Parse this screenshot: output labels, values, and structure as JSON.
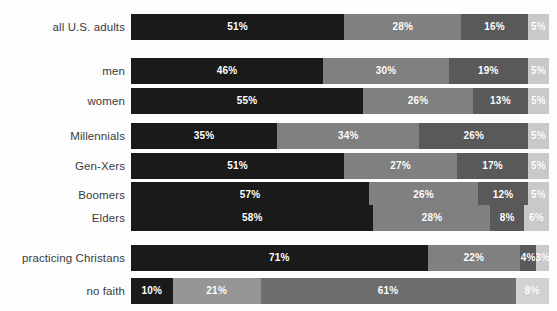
{
  "chart_data": {
    "type": "bar",
    "subtype": "horizontal-stacked-100",
    "title": "",
    "subtitle": "",
    "xlabel": "",
    "ylabel": "",
    "xlim": [
      0,
      100
    ],
    "grid": false,
    "legend": "none",
    "stacked": true,
    "unit": "%",
    "categories": [
      "all U.S. adults",
      "men",
      "women",
      "Millennials",
      "Gen-Xers",
      "Boomers",
      "Elders",
      "practicing Christans",
      "no faith"
    ],
    "series": [
      {
        "name": "segment-1",
        "values": [
          51,
          46,
          55,
          35,
          51,
          57,
          58,
          71,
          10
        ]
      },
      {
        "name": "segment-2",
        "values": [
          28,
          30,
          26,
          34,
          27,
          26,
          28,
          22,
          21
        ]
      },
      {
        "name": "segment-3",
        "values": [
          16,
          19,
          13,
          26,
          17,
          12,
          8,
          4,
          61
        ]
      },
      {
        "name": "segment-4",
        "values": [
          5,
          5,
          5,
          5,
          5,
          5,
          6,
          3,
          8
        ]
      }
    ],
    "rows": [
      {
        "label": "all U.S. adults",
        "group": 0,
        "segments": [
          {
            "value": 51,
            "label": "51%",
            "color": "#1a1a1a"
          },
          {
            "value": 28,
            "label": "28%",
            "color": "#808080"
          },
          {
            "value": 16,
            "label": "16%",
            "color": "#595959"
          },
          {
            "value": 5,
            "label": "5%",
            "color": "#c9c9c9"
          }
        ]
      },
      {
        "label": "men",
        "group": 1,
        "segments": [
          {
            "value": 46,
            "label": "46%",
            "color": "#1a1a1a"
          },
          {
            "value": 30,
            "label": "30%",
            "color": "#808080"
          },
          {
            "value": 19,
            "label": "19%",
            "color": "#595959"
          },
          {
            "value": 5,
            "label": "5%",
            "color": "#c9c9c9"
          }
        ]
      },
      {
        "label": "women",
        "group": 1,
        "segments": [
          {
            "value": 55,
            "label": "55%",
            "color": "#1a1a1a"
          },
          {
            "value": 26,
            "label": "26%",
            "color": "#808080"
          },
          {
            "value": 13,
            "label": "13%",
            "color": "#595959"
          },
          {
            "value": 5,
            "label": "5%",
            "color": "#c9c9c9"
          }
        ]
      },
      {
        "label": "Millennials",
        "group": 2,
        "segments": [
          {
            "value": 35,
            "label": "35%",
            "color": "#1a1a1a"
          },
          {
            "value": 34,
            "label": "34%",
            "color": "#808080"
          },
          {
            "value": 26,
            "label": "26%",
            "color": "#595959"
          },
          {
            "value": 5,
            "label": "5%",
            "color": "#c9c9c9"
          }
        ]
      },
      {
        "label": "Gen-Xers",
        "group": 2,
        "segments": [
          {
            "value": 51,
            "label": "51%",
            "color": "#1a1a1a"
          },
          {
            "value": 27,
            "label": "27%",
            "color": "#808080"
          },
          {
            "value": 17,
            "label": "17%",
            "color": "#595959"
          },
          {
            "value": 5,
            "label": "5%",
            "color": "#c9c9c9"
          }
        ]
      },
      {
        "label": "Boomers",
        "group": 2,
        "segments": [
          {
            "value": 57,
            "label": "57%",
            "color": "#1a1a1a"
          },
          {
            "value": 26,
            "label": "26%",
            "color": "#808080"
          },
          {
            "value": 12,
            "label": "12%",
            "color": "#595959"
          },
          {
            "value": 5,
            "label": "5%",
            "color": "#c9c9c9"
          }
        ]
      },
      {
        "label": "Elders",
        "group": 2,
        "segments": [
          {
            "value": 58,
            "label": "58%",
            "color": "#1a1a1a"
          },
          {
            "value": 28,
            "label": "28%",
            "color": "#808080"
          },
          {
            "value": 8,
            "label": "8%",
            "color": "#595959"
          },
          {
            "value": 6,
            "label": "6%",
            "color": "#c9c9c9"
          }
        ]
      },
      {
        "label": "practicing Christans",
        "group": 3,
        "segments": [
          {
            "value": 71,
            "label": "71%",
            "color": "#1a1a1a"
          },
          {
            "value": 22,
            "label": "22%",
            "color": "#808080"
          },
          {
            "value": 4,
            "label": "4%",
            "color": "#595959"
          },
          {
            "value": 3,
            "label": "3%",
            "color": "#c9c9c9"
          }
        ]
      },
      {
        "label": "no faith",
        "group": 4,
        "segments": [
          {
            "value": 10,
            "label": "10%",
            "color": "#1a1a1a"
          },
          {
            "value": 21,
            "label": "21%",
            "color": "#969696"
          },
          {
            "value": 61,
            "label": "61%",
            "color": "#6e6e6e"
          },
          {
            "value": 8,
            "label": "8%",
            "color": "#d2d2d2"
          }
        ]
      }
    ]
  },
  "layout": {
    "bar_left_px": 131,
    "bar_width_px": 418,
    "row_height_px": 26,
    "row_tops_px": [
      14,
      58,
      88,
      123,
      153,
      182,
      205,
      245,
      278
    ]
  }
}
